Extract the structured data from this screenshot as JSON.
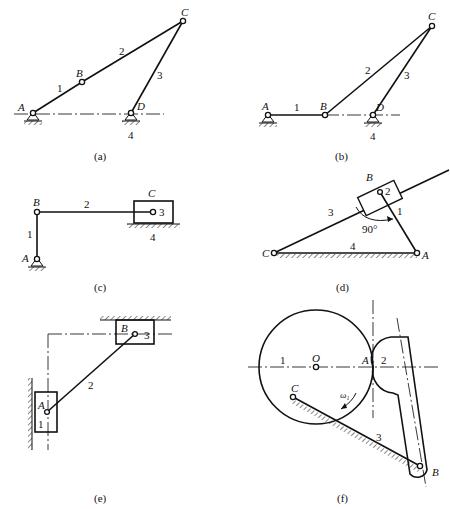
{
  "figures": [
    {
      "id": "a",
      "caption": "(a)",
      "labels": {
        "A": "A",
        "B": "B",
        "C": "C",
        "D": "D",
        "l1": "1",
        "l2": "2",
        "l3": "3",
        "l4": "4"
      }
    },
    {
      "id": "b",
      "caption": "(b)",
      "labels": {
        "A": "A",
        "B": "B",
        "C": "C",
        "D": "D",
        "l1": "1",
        "l2": "2",
        "l3": "3",
        "l4": "4"
      }
    },
    {
      "id": "c",
      "caption": "(c)",
      "labels": {
        "A": "A",
        "B": "B",
        "C": "C",
        "l1": "1",
        "l2": "2",
        "l3": "3",
        "l4": "4"
      }
    },
    {
      "id": "d",
      "caption": "(d)",
      "labels": {
        "A": "A",
        "B": "B",
        "C": "C",
        "l1": "1",
        "l2": "2",
        "l3": "3",
        "l4": "4",
        "angle": "90°"
      }
    },
    {
      "id": "e",
      "caption": "(e)",
      "labels": {
        "A": "A",
        "B": "B",
        "l1": "1",
        "l2": "2",
        "l3": "3"
      }
    },
    {
      "id": "f",
      "caption": "(f)",
      "labels": {
        "A": "A",
        "B": "B",
        "C": "C",
        "O": "O",
        "l1": "1",
        "l2": "2",
        "l3": "3",
        "omega": "ω₁"
      }
    }
  ]
}
